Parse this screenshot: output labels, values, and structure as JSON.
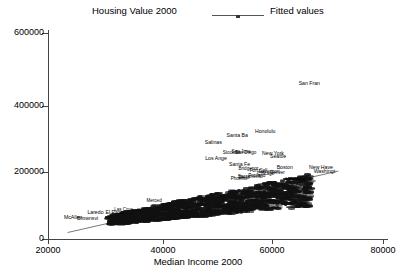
{
  "legend": {
    "series_label": "Housing Value 2000",
    "fit_label": "Fitted values",
    "line_icon": "fitted-line-icon"
  },
  "axes": {
    "x_title": "Median Income 2000",
    "y_title": "",
    "x_ticks": [
      "20000",
      "40000",
      "60000",
      "80000"
    ],
    "y_ticks": [
      "0",
      "200000",
      "400000",
      "600000"
    ]
  },
  "chart_data": {
    "type": "scatter",
    "title": "",
    "xlabel": "Median Income 2000",
    "ylabel": "Housing Value 2000",
    "xlim": [
      20000,
      80000
    ],
    "ylim": [
      0,
      600000
    ],
    "xticks": [
      20000,
      40000,
      60000,
      80000
    ],
    "yticks": [
      0,
      200000,
      400000,
      600000
    ],
    "grid": false,
    "legend_position": "top",
    "marker_style": "text-label",
    "series": [
      {
        "name": "Housing Value 2000",
        "points": [
          {
            "label": "San Fran",
            "x": 66800,
            "y": 452000
          },
          {
            "label": "Honolulu",
            "x": 58900,
            "y": 310000
          },
          {
            "label": "Santa Ba",
            "x": 53900,
            "y": 298000
          },
          {
            "label": "Salinas",
            "x": 49600,
            "y": 278000
          },
          {
            "label": "San Jose",
            "x": 54600,
            "y": 252000
          },
          {
            "label": "Stockton",
            "x": 52900,
            "y": 250000
          },
          {
            "label": "San Diego",
            "x": 55400,
            "y": 249000
          },
          {
            "label": "New York",
            "x": 60300,
            "y": 246000
          },
          {
            "label": "Seattle",
            "x": 61200,
            "y": 236000
          },
          {
            "label": "Los Ange",
            "x": 50100,
            "y": 232000
          },
          {
            "label": "Santa Fe",
            "x": 54300,
            "y": 214000
          },
          {
            "label": "Bridgepor",
            "x": 55900,
            "y": 203000
          },
          {
            "label": "Boston",
            "x": 62400,
            "y": 205000
          },
          {
            "label": "New Have",
            "x": 68900,
            "y": 204000
          },
          {
            "label": "Washingt",
            "x": 69500,
            "y": 194000
          },
          {
            "label": "Fort Coll",
            "x": 57700,
            "y": 196000
          },
          {
            "label": "Davenport",
            "x": 59600,
            "y": 193000
          },
          {
            "label": "Denver",
            "x": 61100,
            "y": 191000
          },
          {
            "label": "Chicago",
            "x": 59000,
            "y": 186000
          },
          {
            "label": "Portland",
            "x": 57400,
            "y": 182000
          },
          {
            "label": "Sacramento",
            "x": 56200,
            "y": 180000
          },
          {
            "label": "Reno",
            "x": 55100,
            "y": 176000
          },
          {
            "label": "Phoenix",
            "x": 54200,
            "y": 174000
          },
          {
            "label": "Minneapo",
            "x": 64300,
            "y": 170000
          },
          {
            "label": "Laredo",
            "x": 28500,
            "y": 72000
          },
          {
            "label": "El Paso",
            "x": 31900,
            "y": 73000
          },
          {
            "label": "McAllen",
            "x": 24500,
            "y": 58000
          },
          {
            "label": "Brownsvi",
            "x": 27100,
            "y": 57000
          },
          {
            "label": "Las Cruc",
            "x": 33500,
            "y": 82000
          },
          {
            "label": "Merced",
            "x": 39000,
            "y": 108000
          }
        ],
        "cluster_note": "Several hundred additional overlapping metro labels form a dense band from roughly (33000, 70000) to (66000, 175000)."
      }
    ],
    "fit_line": {
      "name": "Fitted values",
      "x_start": 23500,
      "y_start": 16000,
      "x_end": 72000,
      "y_end": 196000
    }
  }
}
